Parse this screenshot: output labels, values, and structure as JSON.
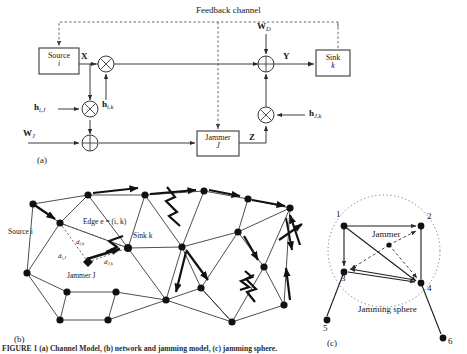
{
  "figure": {
    "caption": "FIGURE 1   (a) Channel Model, (b) network and jamming model, (c) jamming sphere.",
    "panels": [
      {
        "tag": "(a)",
        "name": "channel-model"
      },
      {
        "tag": "(b)",
        "name": "network-jamming-model"
      },
      {
        "tag": "(c)",
        "name": "jamming-sphere"
      }
    ]
  },
  "panel_a": {
    "tag": "(a)",
    "feedback_label": "Feedback channel",
    "source_box": {
      "line1": "Source",
      "line2": "i"
    },
    "sink_box": {
      "line1": "Sink",
      "line2": "k"
    },
    "jammer_box": {
      "line1": "Jammer",
      "line2": "J"
    },
    "signals": {
      "x": "X",
      "y": "Y",
      "z": "Z",
      "w_d": "W",
      "w_d_sub": "D",
      "w_j": "W",
      "w_j_sub": "J",
      "h_ij": "h",
      "h_ij_sub": "i,J",
      "h_ik": "h",
      "h_ik_sub": "i,k",
      "h_jk": "h",
      "h_jk_sub": "J,k"
    },
    "operators": {
      "multiply": "⊗",
      "add": "⊕"
    }
  },
  "panel_b": {
    "tag": "(b)",
    "labels": {
      "source": "Source i",
      "sink": "Sink k",
      "edge": "Edge e = (i, k)",
      "jammer": "Jammer J",
      "d_ik": "d",
      "d_ik_sub": "i,k",
      "d_ij": "d",
      "d_ij_sub": "i,J",
      "d_jk": "d",
      "d_jk_sub": "J,k"
    },
    "nodes": [
      {
        "id": "n1",
        "x": 33,
        "y": 204
      },
      {
        "id": "n2",
        "x": 88,
        "y": 195
      },
      {
        "id": "n3",
        "x": 145,
        "y": 195
      },
      {
        "id": "n4",
        "x": 204,
        "y": 191
      },
      {
        "id": "n5",
        "x": 175,
        "y": 214
      },
      {
        "id": "n6",
        "x": 248,
        "y": 199
      },
      {
        "id": "n7",
        "x": 60,
        "y": 223
      },
      {
        "id": "n8",
        "x": 128,
        "y": 248
      },
      {
        "id": "n9",
        "x": 182,
        "y": 247
      },
      {
        "id": "n10",
        "x": 238,
        "y": 232
      },
      {
        "id": "n11",
        "x": 290,
        "y": 208
      },
      {
        "id": "n12",
        "x": 27,
        "y": 273
      },
      {
        "id": "n13",
        "x": 67,
        "y": 292
      },
      {
        "id": "n14",
        "x": 116,
        "y": 292
      },
      {
        "id": "n15",
        "x": 60,
        "y": 320
      },
      {
        "id": "n16",
        "x": 108,
        "y": 320
      },
      {
        "id": "n17",
        "x": 166,
        "y": 300
      },
      {
        "id": "n18",
        "x": 201,
        "y": 288
      },
      {
        "id": "n19",
        "x": 232,
        "y": 322
      },
      {
        "id": "n20",
        "x": 284,
        "y": 305
      },
      {
        "id": "n21",
        "x": 264,
        "y": 267
      }
    ],
    "jammer_node": {
      "x": 88,
      "y": 262
    }
  },
  "panel_c": {
    "tag": "(c)",
    "sphere_label": "Jamming sphere",
    "jammer_label": "Jammer",
    "nodes": [
      {
        "id": "1",
        "label": "1",
        "x": 344,
        "y": 226
      },
      {
        "id": "2",
        "label": "2",
        "x": 421,
        "y": 226
      },
      {
        "id": "3",
        "label": "3",
        "x": 344,
        "y": 272
      },
      {
        "id": "4",
        "label": "4",
        "x": 421,
        "y": 283
      },
      {
        "id": "5",
        "label": "5",
        "x": 327,
        "y": 320
      },
      {
        "id": "6",
        "label": "6",
        "x": 443,
        "y": 338
      }
    ],
    "jammer_node": {
      "x": 389,
      "y": 245
    }
  },
  "colors": {
    "ink": "#161616",
    "line": "#3a3a3a",
    "dashed": "#555555",
    "background": "#ffffff"
  }
}
